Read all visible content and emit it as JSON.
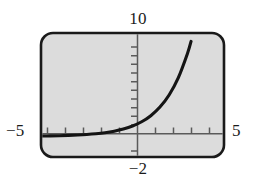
{
  "figure": {
    "screen": {
      "fill_color": "#dcdcdc",
      "border_color": "#1a1a1a",
      "corner_radius": 12
    },
    "labels": {
      "y_max": "10",
      "y_min": "−2",
      "x_min": "−5",
      "x_max": "5"
    },
    "icon_names": {
      "y_axis": "vertical-axis-icon",
      "x_axis": "horizontal-axis-icon",
      "curve": "exponential-curve-icon",
      "frame": "calculator-screen-frame-icon"
    }
  },
  "chart_data": {
    "type": "line",
    "title": "",
    "xlabel": "",
    "ylabel": "",
    "xlim": [
      -5,
      5
    ],
    "ylim": [
      -2,
      10
    ],
    "grid": false,
    "legend": null,
    "background": "#dcdcdc",
    "line_color": "#141414",
    "axis_color": "#555555",
    "x_tick_interval": 1,
    "y_tick_interval": 1,
    "x_ticks": [
      -4,
      -3,
      -2,
      -1,
      1,
      2,
      3,
      4
    ],
    "y_ticks": [
      1,
      2,
      3,
      4,
      5,
      6,
      7,
      8,
      9,
      -1
    ],
    "tick_side": {
      "x": "above-axis",
      "y": "left-of-axis"
    },
    "annotations": [
      {
        "text": "10",
        "position": "above-y-axis-top"
      },
      {
        "text": "−2",
        "position": "below-y-axis-bottom"
      },
      {
        "text": "−5",
        "position": "left-of-x-axis"
      },
      {
        "text": "5",
        "position": "right-of-x-axis"
      }
    ],
    "series": [
      {
        "name": "exponential",
        "equation": "y = 2^x",
        "x": [
          -5.0,
          -4.5,
          -4.0,
          -3.5,
          -3.0,
          -2.5,
          -2.0,
          -1.5,
          -1.0,
          -0.5,
          0.0,
          0.5,
          1.0,
          1.5,
          2.0,
          2.5,
          3.0,
          3.2
        ],
        "y": [
          0.03,
          0.04,
          0.06,
          0.09,
          0.13,
          0.18,
          0.25,
          0.35,
          0.5,
          0.71,
          1.0,
          1.41,
          2.0,
          2.83,
          4.0,
          5.66,
          8.0,
          9.19
        ]
      }
    ]
  }
}
